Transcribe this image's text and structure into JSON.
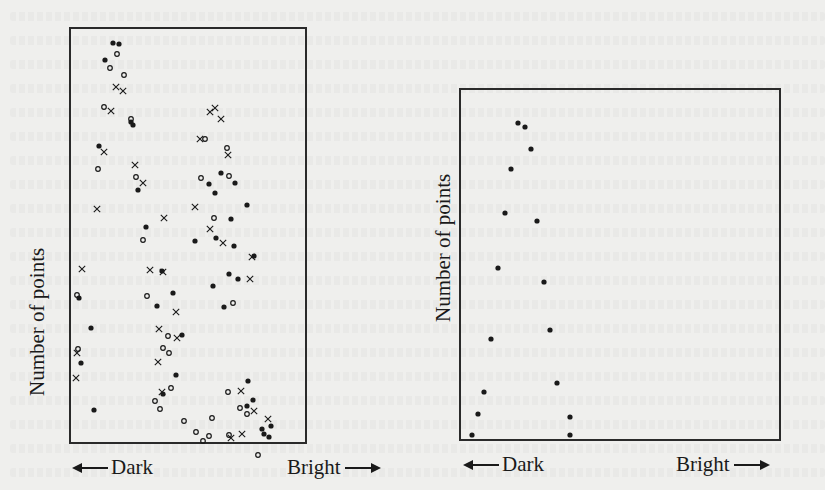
{
  "chart_data": [
    {
      "type": "scatter",
      "title": "",
      "ylabel": "Number of points",
      "xlabel_left": "Dark",
      "xlabel_right": "Bright",
      "frame": {
        "left": 69,
        "top": 27,
        "width": 234,
        "height": 413
      },
      "grid": false,
      "series": [
        {
          "name": "filled-dots",
          "marker": "filled-circle",
          "points": [
            [
              113,
              43
            ],
            [
              119,
              44
            ],
            [
              105,
              60
            ],
            [
              131,
              122
            ],
            [
              133,
              125
            ],
            [
              99,
              146
            ],
            [
              138,
              190
            ],
            [
              221,
              173
            ],
            [
              209,
              184
            ],
            [
              215,
              193
            ],
            [
              235,
              183
            ],
            [
              231,
              219
            ],
            [
              234,
              246
            ],
            [
              229,
              274
            ],
            [
              224,
              307
            ],
            [
              146,
              227
            ],
            [
              91,
              328
            ],
            [
              81,
              363
            ],
            [
              79,
              298
            ],
            [
              94,
              410
            ],
            [
              157,
              306
            ],
            [
              162,
              271
            ],
            [
              216,
              238
            ],
            [
              195,
              241
            ],
            [
              182,
              335
            ],
            [
              213,
              286
            ],
            [
              173,
              293
            ],
            [
              176,
              375
            ],
            [
              163,
              394
            ],
            [
              247,
              406
            ],
            [
              262,
              429
            ],
            [
              264,
              434
            ],
            [
              269,
              437
            ],
            [
              271,
              426
            ],
            [
              253,
              400
            ],
            [
              248,
              381
            ],
            [
              254,
              256
            ],
            [
              247,
              205
            ],
            [
              238,
              279
            ]
          ]
        },
        {
          "name": "hollow-circles",
          "marker": "open-circle",
          "points": [
            [
              117,
              54
            ],
            [
              110,
              68
            ],
            [
              124,
              75
            ],
            [
              104,
              107
            ],
            [
              131,
              119
            ],
            [
              98,
              169
            ],
            [
              136,
              177
            ],
            [
              143,
              240
            ],
            [
              205,
              139
            ],
            [
              201,
              178
            ],
            [
              227,
              148
            ],
            [
              229,
              176
            ],
            [
              214,
              218
            ],
            [
              233,
              303
            ],
            [
              77,
              295
            ],
            [
              78,
              349
            ],
            [
              147,
              296
            ],
            [
              163,
              348
            ],
            [
              155,
              401
            ],
            [
              160,
              409
            ],
            [
              171,
              388
            ],
            [
              169,
              353
            ],
            [
              168,
              336
            ],
            [
              184,
              421
            ],
            [
              196,
              432
            ],
            [
              228,
              392
            ],
            [
              240,
              408
            ],
            [
              247,
              414
            ],
            [
              229,
              435
            ],
            [
              258,
              455
            ],
            [
              203,
              441
            ],
            [
              209,
              436
            ],
            [
              212,
              418
            ]
          ]
        },
        {
          "name": "crosses",
          "marker": "x",
          "points": [
            [
              116,
              87
            ],
            [
              123,
              91
            ],
            [
              111,
              111
            ],
            [
              104,
              152
            ],
            [
              135,
              165
            ],
            [
              210,
              112
            ],
            [
              215,
              108
            ],
            [
              221,
              119
            ],
            [
              200,
              139
            ],
            [
              228,
              155
            ],
            [
              195,
              207
            ],
            [
              164,
              218
            ],
            [
              143,
              183
            ],
            [
              97,
              209
            ],
            [
              82,
              269
            ],
            [
              77,
              353
            ],
            [
              76,
              378
            ],
            [
              150,
              270
            ],
            [
              163,
              272
            ],
            [
              176,
              312
            ],
            [
              177,
              338
            ],
            [
              159,
              329
            ],
            [
              158,
              362
            ],
            [
              162,
              392
            ],
            [
              210,
              229
            ],
            [
              223,
              243
            ],
            [
              252,
              257
            ],
            [
              250,
              279
            ],
            [
              241,
              391
            ],
            [
              268,
              419
            ],
            [
              254,
              411
            ],
            [
              242,
              434
            ],
            [
              231,
              438
            ]
          ]
        }
      ]
    },
    {
      "type": "scatter",
      "title": "",
      "ylabel": "Number of points",
      "xlabel_left": "Dark",
      "xlabel_right": "Bright",
      "frame": {
        "left": 459,
        "top": 88,
        "width": 318,
        "height": 349
      },
      "grid": false,
      "series": [
        {
          "name": "filled-dots",
          "marker": "filled-circle",
          "points": [
            [
              518,
              123
            ],
            [
              525,
              127
            ],
            [
              531,
              149
            ],
            [
              511,
              169
            ],
            [
              505,
              213
            ],
            [
              537,
              221
            ],
            [
              498,
              268
            ],
            [
              544,
              282
            ],
            [
              491,
              339
            ],
            [
              550,
              330
            ],
            [
              484,
              392
            ],
            [
              557,
              383
            ],
            [
              478,
              414
            ],
            [
              570,
              417
            ],
            [
              472,
              435
            ],
            [
              570,
              435
            ]
          ]
        }
      ]
    }
  ],
  "left_chart": {
    "ylabel": "Number of points",
    "xlabel_left": "Dark",
    "xlabel_right": "Bright"
  },
  "right_chart": {
    "ylabel": "Number of points",
    "xlabel_left": "Dark",
    "xlabel_right": "Bright"
  },
  "colors": {
    "ink": "#1a1a1a",
    "paper": "#efefed",
    "frame": "#2a2a2a"
  }
}
